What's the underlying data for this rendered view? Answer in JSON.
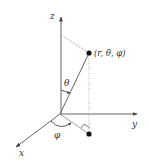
{
  "diagram": {
    "axes": {
      "x_label": "x",
      "y_label": "y",
      "z_label": "z"
    },
    "point_label": "(r, θ, φ)",
    "angles": {
      "theta_label": "θ",
      "phi_label": "φ"
    },
    "colors": {
      "axis": "#555555",
      "dashed": "#888888",
      "point": "#111111",
      "text": "#333333"
    },
    "geometry": {
      "origin": [
        60,
        114
      ],
      "point": [
        89,
        53
      ],
      "projection": [
        89,
        134
      ],
      "z_tip": [
        61,
        16
      ],
      "y_tip": [
        137,
        114
      ],
      "x_tip": [
        15,
        148
      ]
    }
  }
}
